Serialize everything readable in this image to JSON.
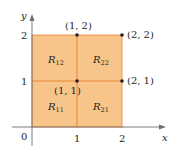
{
  "diagram": {
    "type": "partitioned-rectangle",
    "axes": {
      "x_label": "x",
      "y_label": "y",
      "origin_label": "0",
      "x_ticks": [
        "1",
        "2"
      ],
      "y_ticks": [
        "1",
        "2"
      ]
    },
    "regions": [
      {
        "id": "R11",
        "label": "R",
        "sub": "11"
      },
      {
        "id": "R12",
        "label": "R",
        "sub": "12"
      },
      {
        "id": "R21",
        "label": "R",
        "sub": "21"
      },
      {
        "id": "R22",
        "label": "R",
        "sub": "22"
      }
    ],
    "points": [
      {
        "label": "(1, 2)",
        "x": 1,
        "y": 2
      },
      {
        "label": "(2, 2)",
        "x": 2,
        "y": 2
      },
      {
        "label": "(2, 1)",
        "x": 2,
        "y": 1
      },
      {
        "label": "(1, 1)",
        "x": 1,
        "y": 1
      }
    ],
    "colors": {
      "fill": "#f7c48a",
      "grid_line": "#e8822e",
      "axis": "#6d6e71",
      "point": "#231f20",
      "text": "#231f20"
    }
  }
}
